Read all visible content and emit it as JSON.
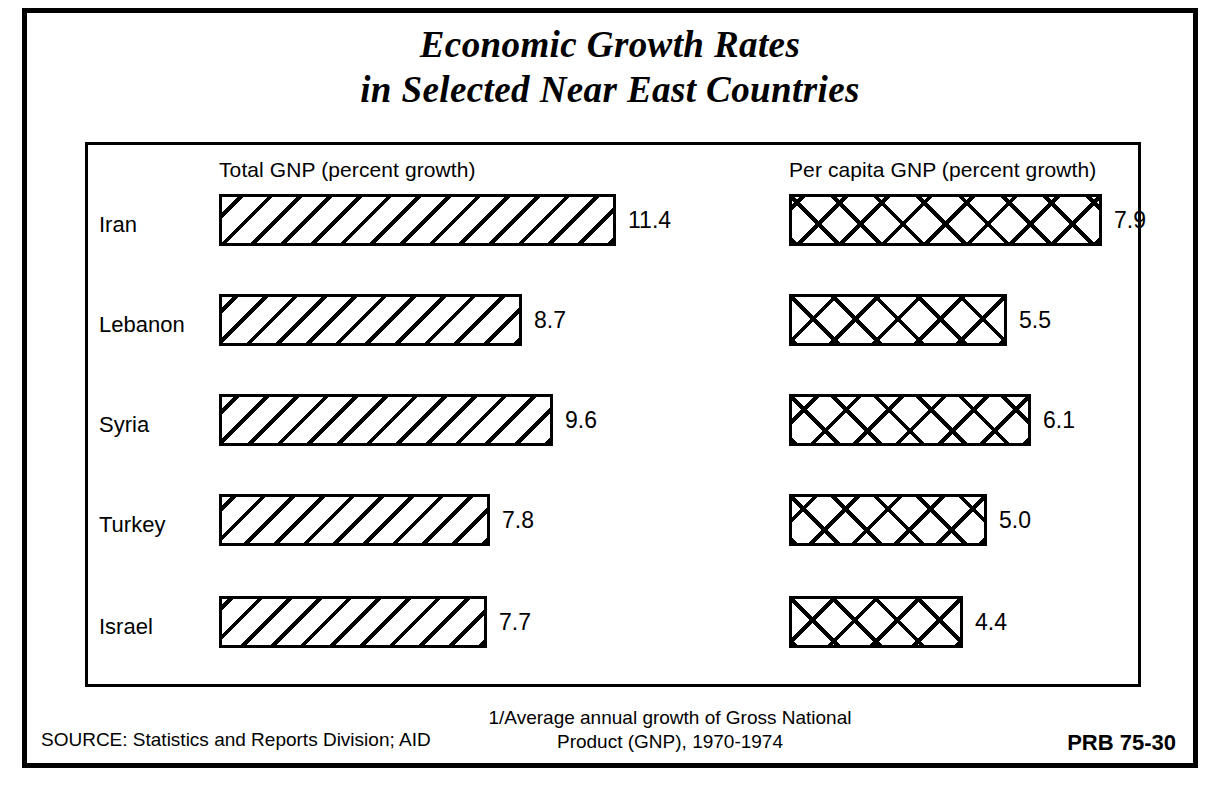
{
  "title": {
    "line1": "Economic Growth Rates",
    "line2": "in Selected Near East Countries"
  },
  "headers": {
    "left": "Total GNP (percent growth)",
    "right": "Per capita GNP (percent growth)"
  },
  "footer": {
    "source": "SOURCE: Statistics and Reports Division; AID",
    "note_line1": "1/Average annual growth of Gross National",
    "note_line2": "Product (GNP), 1970-1974",
    "code": "PRB 75-30"
  },
  "rows": [
    {
      "label": "Iran",
      "total": "11.4",
      "percapita": "7.9"
    },
    {
      "label": "Lebanon",
      "total": "8.7",
      "percapita": "5.5"
    },
    {
      "label": "Syria",
      "total": "9.6",
      "percapita": "6.1"
    },
    {
      "label": "Turkey",
      "total": "7.8",
      "percapita": "5.0"
    },
    {
      "label": "Israel",
      "total": "7.7",
      "percapita": "4.4"
    }
  ],
  "chart_data": {
    "type": "bar",
    "orientation": "horizontal",
    "title": "Economic Growth Rates in Selected Near East Countries",
    "subtitle": "Average annual growth of Gross National Product (GNP), 1970-1974",
    "categories": [
      "Iran",
      "Lebanon",
      "Syria",
      "Turkey",
      "Israel"
    ],
    "series": [
      {
        "name": "Total GNP (percent growth)",
        "values": [
          11.4,
          8.7,
          9.6,
          7.8,
          7.7
        ]
      },
      {
        "name": "Per capita GNP (percent growth)",
        "values": [
          7.9,
          5.5,
          6.1,
          5.0,
          4.4
        ]
      }
    ],
    "xlabel": "percent growth",
    "ylabel": "",
    "xlim": [
      0,
      11.4
    ],
    "grid": false,
    "legend": "column-headers",
    "value_labels": true,
    "colors": {
      "fill": "#ffffff",
      "stroke": "#000000",
      "background": "#ffffff"
    }
  },
  "layout": {
    "left_bar_origin_px": 219,
    "right_bar_origin_px": 789,
    "left_px_per_unit": 34.8,
    "right_px_per_unit": 39.6,
    "row_tops_px": [
      190,
      290,
      390,
      490,
      592
    ],
    "bar_height_px": 52
  }
}
